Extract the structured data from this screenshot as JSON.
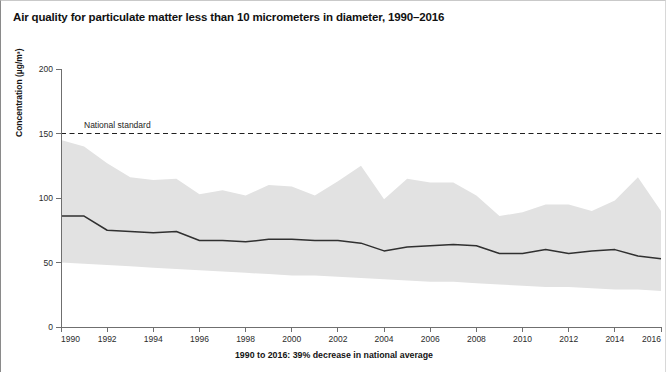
{
  "figure": {
    "title": "Air quality for particulate matter less than 10 micrometers in diameter, 1990–2016",
    "y_axis_title": "Concentration (µg/m³)",
    "x_caption": "1990 to 2016: 39% decrease in national average",
    "annotation_label": "National standard"
  },
  "colors": {
    "band": "#e2e2e2",
    "line": "#303030",
    "axis": "#6f6f6f",
    "text": "#141414"
  },
  "chart_data": {
    "type": "line",
    "title": "Air quality for particulate matter less than 10 micrometers in diameter, 1990–2016",
    "subtitle": "1990 to 2016: 39% decrease in national average",
    "xlabel": "",
    "ylabel": "Concentration (µg/m³)",
    "xlim": [
      1990,
      2016
    ],
    "ylim": [
      0,
      200
    ],
    "ytick_labels": [
      "0",
      "50",
      "100",
      "150",
      "200"
    ],
    "yticks": [
      0,
      50,
      100,
      150,
      200
    ],
    "xticks": [
      1990,
      1992,
      1994,
      1996,
      1998,
      2000,
      2002,
      2004,
      2006,
      2008,
      2010,
      2012,
      2014,
      2016
    ],
    "xtick_labels": [
      "1990",
      "1992",
      "1994",
      "1996",
      "1998",
      "2000",
      "2002",
      "2004",
      "2006",
      "2008",
      "2010",
      "2012",
      "2014",
      "2016"
    ],
    "grid": false,
    "legend": "none",
    "x": [
      1990,
      1991,
      1992,
      1993,
      1994,
      1995,
      1996,
      1997,
      1998,
      1999,
      2000,
      2001,
      2002,
      2003,
      2004,
      2005,
      2006,
      2007,
      2008,
      2009,
      2010,
      2011,
      2012,
      2013,
      2014,
      2015,
      2016
    ],
    "series": [
      {
        "name": "National average",
        "type": "line",
        "values": [
          86,
          86,
          75,
          74,
          73,
          74,
          67,
          67,
          66,
          68,
          68,
          67,
          67,
          65,
          59,
          62,
          63,
          64,
          63,
          57,
          57,
          60,
          57,
          59,
          60,
          55,
          53
        ]
      },
      {
        "name": "90th percentile (band upper bound)",
        "type": "band_upper",
        "values": [
          145,
          140,
          127,
          116,
          114,
          115,
          103,
          106,
          102,
          110,
          109,
          102,
          113,
          125,
          99,
          115,
          112,
          112,
          102,
          86,
          89,
          95,
          95,
          90,
          98,
          116,
          90
        ]
      },
      {
        "name": "10th percentile (band lower bound)",
        "type": "band_lower",
        "values": [
          50,
          49,
          48,
          47,
          46,
          45,
          44,
          43,
          42,
          41,
          40,
          40,
          39,
          38,
          37,
          36,
          35,
          35,
          34,
          33,
          32,
          31,
          31,
          30,
          29,
          29,
          28
        ]
      }
    ],
    "annotations": [
      {
        "label": "National standard",
        "type": "hline",
        "y": 150,
        "style": "dashed"
      }
    ]
  }
}
